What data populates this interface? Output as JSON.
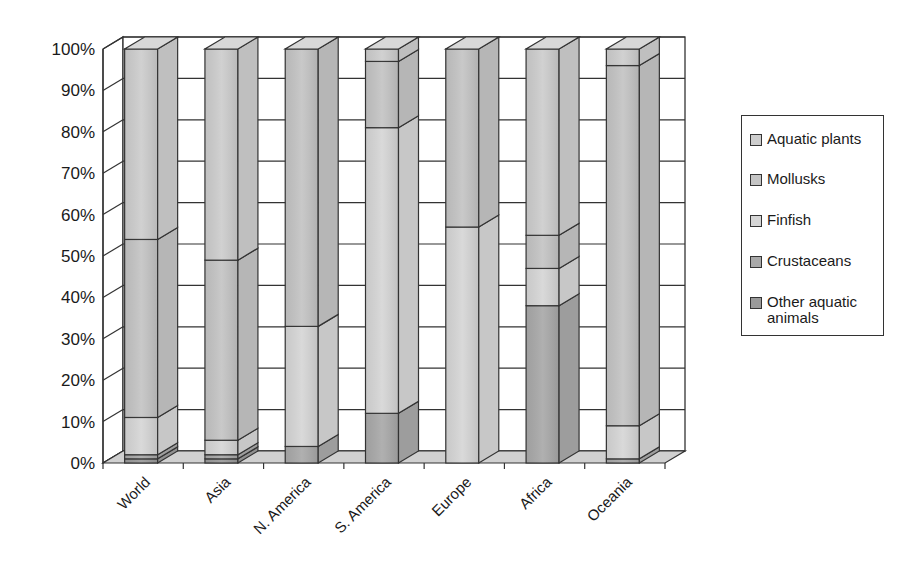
{
  "chart_data": {
    "type": "bar",
    "subtype": "3d-stacked-100-percent",
    "title": "",
    "xlabel": "",
    "ylabel": "",
    "ylim": [
      0,
      100
    ],
    "yticks": [
      "0%",
      "10%",
      "20%",
      "30%",
      "40%",
      "50%",
      "60%",
      "70%",
      "80%",
      "90%",
      "100%"
    ],
    "grid": true,
    "legend_position": "right",
    "categories": [
      "World",
      "Asia",
      "N. America",
      "S. America",
      "Europe",
      "Africa",
      "Oceania"
    ],
    "series": [
      {
        "name": "Other aquatic animals",
        "color": "#9a9a9a",
        "values": [
          1,
          1,
          0,
          0,
          0,
          0,
          0
        ]
      },
      {
        "name": "Crustaceans",
        "color": "#a9a9a9",
        "values": [
          1,
          1,
          4,
          12,
          0,
          38,
          1
        ]
      },
      {
        "name": "Finfish",
        "color": "#d6d6d6",
        "values": [
          9,
          3.5,
          29,
          69,
          57,
          9,
          8
        ]
      },
      {
        "name": "Mollusks",
        "color": "#c4c4c4",
        "values": [
          43,
          43.5,
          67,
          16,
          43,
          8,
          87
        ]
      },
      {
        "name": "Aquatic plants",
        "color": "#cdcdcd",
        "values": [
          46,
          51,
          0,
          3,
          0,
          45,
          4
        ]
      }
    ]
  },
  "legend": {
    "items": [
      {
        "label": "Aquatic plants",
        "color": "#cdcdcd"
      },
      {
        "label": "Mollusks",
        "color": "#c4c4c4"
      },
      {
        "label": "Finfish",
        "color": "#d6d6d6"
      },
      {
        "label": "Crustaceans",
        "color": "#a9a9a9"
      },
      {
        "label": "Other aquatic",
        "label2": "animals",
        "color": "#9a9a9a"
      }
    ]
  }
}
